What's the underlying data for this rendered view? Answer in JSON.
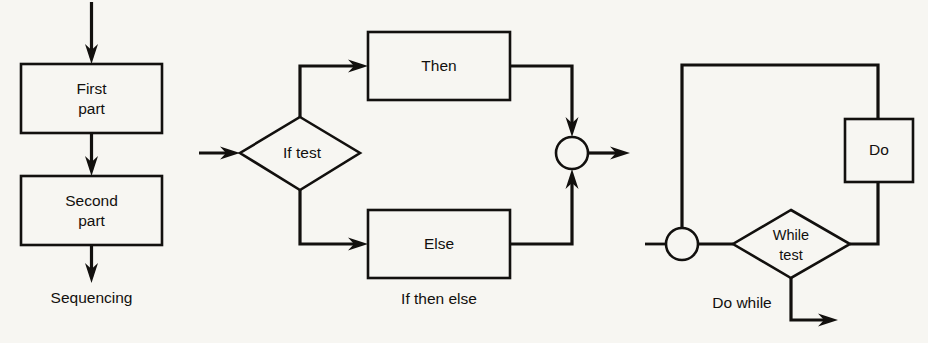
{
  "figure": {
    "background_color": "#f7f6f2",
    "line_color": "#12100e"
  },
  "panels": [
    {
      "id": "sequencing",
      "caption": "Sequencing",
      "nodes": [
        {
          "id": "first-part",
          "shape": "process",
          "line1": "First",
          "line2": "part"
        },
        {
          "id": "second-part",
          "shape": "process",
          "line1": "Second",
          "line2": "part"
        }
      ]
    },
    {
      "id": "if-then-else",
      "caption": "If then else",
      "nodes": [
        {
          "id": "if-test",
          "shape": "decision",
          "line1": "If test",
          "line2": ""
        },
        {
          "id": "then",
          "shape": "process",
          "line1": "Then",
          "line2": ""
        },
        {
          "id": "else",
          "shape": "process",
          "line1": "Else",
          "line2": ""
        },
        {
          "id": "merge",
          "shape": "connector",
          "line1": "",
          "line2": ""
        }
      ]
    },
    {
      "id": "do-while",
      "caption": "Do while",
      "nodes": [
        {
          "id": "loop-junction",
          "shape": "connector",
          "line1": "",
          "line2": ""
        },
        {
          "id": "while-test",
          "shape": "decision",
          "line1": "While",
          "line2": "test"
        },
        {
          "id": "do",
          "shape": "process",
          "line1": "Do",
          "line2": ""
        }
      ]
    }
  ]
}
